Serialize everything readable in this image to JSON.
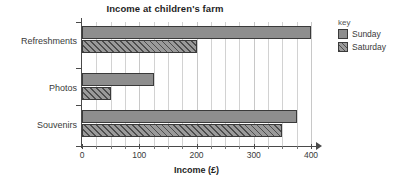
{
  "chart_data": {
    "type": "bar",
    "orientation": "horizontal",
    "title": "Income at children's farm",
    "xlabel": "Income (£)",
    "ylabel": "",
    "categories": [
      "Refreshments",
      "Photos",
      "Souvenirs"
    ],
    "series": [
      {
        "name": "Sunday",
        "values": [
          400,
          125,
          375
        ],
        "color": "#8e8e8e",
        "fill": "solid"
      },
      {
        "name": "Saturday",
        "values": [
          200,
          50,
          350
        ],
        "color": "#9a9a9a",
        "fill": "diagonal-hatch"
      }
    ],
    "xlim": [
      0,
      400
    ],
    "xticks": [
      0,
      100,
      200,
      300,
      400
    ],
    "xtick_labels": [
      "0",
      "100",
      "200",
      "300",
      "400"
    ],
    "minor_tick_interval": 25,
    "grid": "vertical",
    "legend_position": "right",
    "legend_title": "key"
  },
  "legend": {
    "title": "key",
    "entries": [
      {
        "label": "Sunday"
      },
      {
        "label": "Saturday"
      }
    ]
  },
  "axes": {
    "x_title": "Income (£)",
    "tick_labels": [
      "0",
      "100",
      "200",
      "300",
      "400"
    ],
    "category_labels": [
      "Refreshments",
      "Photos",
      "Souvenirs"
    ]
  }
}
